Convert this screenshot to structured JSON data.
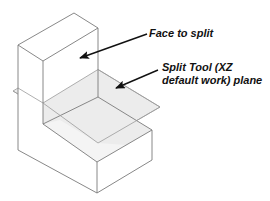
{
  "labels": {
    "face_to_split": "Face to split",
    "split_tool_line1": "Split Tool (XZ",
    "split_tool_line2": "default work) plane"
  },
  "colors": {
    "edge": "#7a7a7a",
    "plane_fill": "#ececec",
    "arrow": "#111111",
    "text": "#111111"
  }
}
